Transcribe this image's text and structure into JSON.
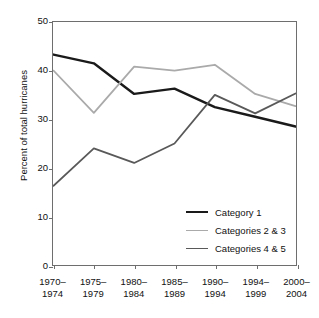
{
  "chart_data": {
    "type": "line",
    "title": "",
    "xlabel": "",
    "ylabel": "Percent of total hurricanes",
    "categories": [
      "1970–\n1974",
      "1975–\n1979",
      "1980–\n1984",
      "1985–\n1989",
      "1990–\n1994",
      "1994–\n1999",
      "2000–\n2004"
    ],
    "category_lines": [
      [
        "1970–",
        "1974"
      ],
      [
        "1975–",
        "1979"
      ],
      [
        "1980–",
        "1984"
      ],
      [
        "1985–",
        "1989"
      ],
      [
        "1990–",
        "1994"
      ],
      [
        "1994–",
        "1999"
      ],
      [
        "2000–",
        "2004"
      ]
    ],
    "series": [
      {
        "name": "Category 1",
        "color": "#1a1a1a",
        "width": 2.4,
        "values": [
          43.3,
          41.5,
          35.2,
          36.3,
          32.5,
          30.5,
          28.5
        ]
      },
      {
        "name": "Categories 2 & 3",
        "color": "#aaaaaa",
        "width": 1.8,
        "values": [
          40.0,
          31.3,
          40.8,
          40.0,
          41.2,
          35.2,
          32.7
        ]
      },
      {
        "name": "Categories 4 & 5",
        "color": "#595959",
        "width": 1.8,
        "values": [
          16.3,
          24.0,
          21.0,
          25.0,
          35.0,
          31.2,
          35.3
        ]
      }
    ],
    "ylim": [
      0,
      50
    ],
    "yticks": [
      0,
      10,
      20,
      30,
      40,
      50
    ],
    "ytick_labels": [
      "0",
      "10",
      "20",
      "30",
      "40",
      "50"
    ],
    "grid": false,
    "legend_position": "inside-lower-right",
    "axis_color": "#6e6e6e",
    "background": "#ffffff"
  }
}
